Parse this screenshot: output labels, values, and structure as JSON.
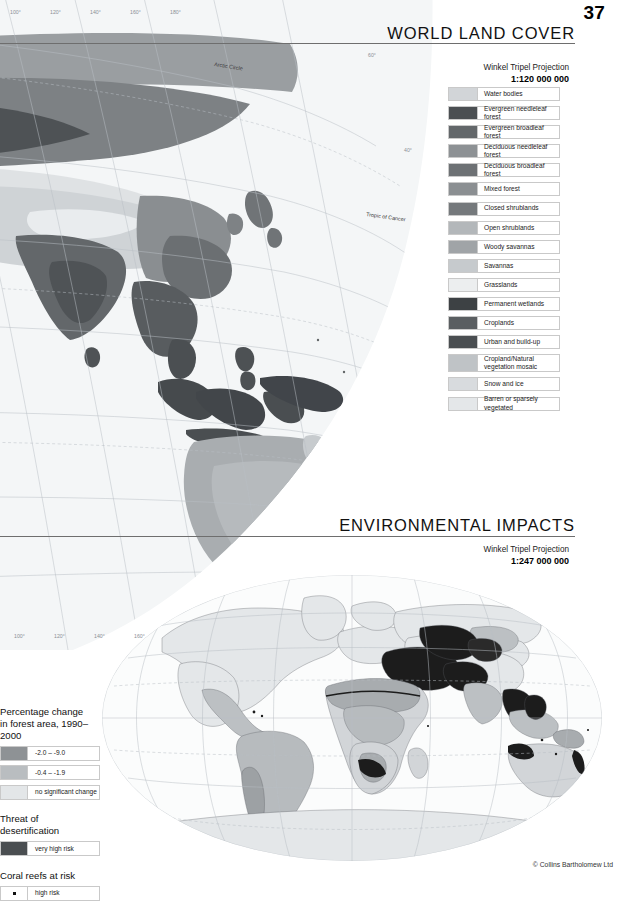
{
  "page": {
    "number": "37",
    "copyright": "© Collins Bartholomew Ltd"
  },
  "maps": [
    {
      "id": "world-land-cover",
      "title": "WORLD LAND COVER",
      "projection_name": "Winkel Tripel Projection",
      "scale": "1:120 000 000",
      "graticule_top_labels": [
        "100°",
        "120°",
        "140°",
        "160°",
        "180°"
      ],
      "graticule_bottom_labels": [
        "100°",
        "120°",
        "140°",
        "160°"
      ],
      "graticule_right_labels": [
        "60°",
        "40°",
        "20°",
        "20°",
        "40°"
      ],
      "named_parallels": [
        "Arctic Circle",
        "Tropic of Cancer",
        "Equator",
        "Tropic of Capricorn"
      ],
      "legend": {
        "items": [
          {
            "label": "Water bodies",
            "color": "#d2d5d8"
          },
          {
            "label": "Evergreen needleleaf forest",
            "color": "#4b4f52"
          },
          {
            "label": "Evergreen broadleaf forest",
            "color": "#63676a"
          },
          {
            "label": "Deciduous needleleaf forest",
            "color": "#8d9194"
          },
          {
            "label": "Deciduous broadleaf forest",
            "color": "#6d7174"
          },
          {
            "label": "Mixed forest",
            "color": "#8b8f92"
          },
          {
            "label": "Closed shrublands",
            "color": "#75797c"
          },
          {
            "label": "Open shrublands",
            "color": "#b3b7ba"
          },
          {
            "label": "Woody savannas",
            "color": "#a0a4a7"
          },
          {
            "label": "Savannas",
            "color": "#c6cacd"
          },
          {
            "label": "Grasslands",
            "color": "#eceeef"
          },
          {
            "label": "Permanent wetlands",
            "color": "#3d4144"
          },
          {
            "label": "Croplands",
            "color": "#5a5e61"
          },
          {
            "label": "Urban and build-up",
            "color": "#4a4e51"
          },
          {
            "label": "Cropland/Natural\nvegetation mosaic",
            "color": "#bfc3c6"
          },
          {
            "label": "Snow and ice",
            "color": "#d8dbde"
          },
          {
            "label": "Barren or sparsely vegetated",
            "color": "#e4e7e9"
          }
        ]
      }
    },
    {
      "id": "environmental-impacts",
      "title": "ENVIRONMENTAL IMPACTS",
      "projection_name": "Winkel Tripel Projection",
      "scale": "1:247 000 000"
    }
  ],
  "legend_left": {
    "groups": [
      {
        "heading": "Percentage change\nin forest area, 1990–2000",
        "items": [
          {
            "label": "-2.0 – -9.0",
            "color": "#8e9295",
            "symbol": "swatch"
          },
          {
            "label": "-0.4 – -1.9",
            "color": "#b9bdc0",
            "symbol": "swatch"
          },
          {
            "label": "no significant change",
            "color": "#e3e6e8",
            "symbol": "swatch"
          }
        ]
      },
      {
        "heading": "Threat of desertification",
        "items": [
          {
            "label": "very high risk",
            "color": "#4a4e51",
            "symbol": "swatch"
          }
        ]
      },
      {
        "heading": "Coral reefs at risk",
        "items": [
          {
            "label": "high risk",
            "color": "#111111",
            "symbol": "dot"
          }
        ]
      }
    ]
  }
}
